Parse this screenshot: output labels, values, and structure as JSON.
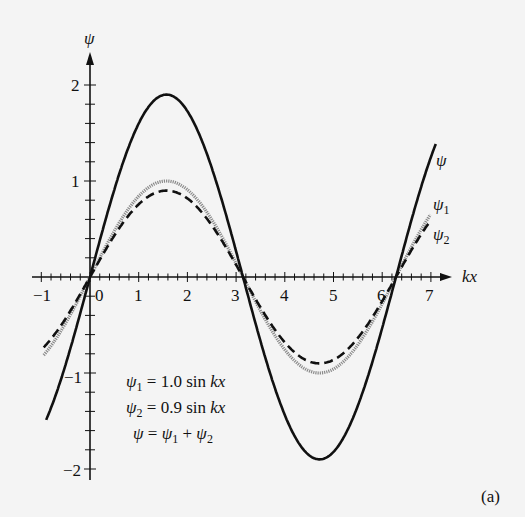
{
  "chart_data": {
    "type": "line",
    "title": "",
    "xlabel": "kx",
    "ylabel": "ψ",
    "xlim": [
      -1,
      7.4
    ],
    "ylim": [
      -2.05,
      2.4
    ],
    "grid": false,
    "x_ticks": [
      "-1",
      "0",
      "1",
      "2",
      "3",
      "4",
      "5",
      "6",
      "7"
    ],
    "y_ticks": [
      "2",
      "1",
      "-1",
      "-2"
    ],
    "series": [
      {
        "name": "ψ",
        "formula": "1.9 sin kx",
        "amplitude": 1.9,
        "style": "solid-thick",
        "color": "#111111"
      },
      {
        "name": "ψ1",
        "formula": "1.0 sin kx",
        "amplitude": 1.0,
        "style": "gray-textured",
        "color": "#888888"
      },
      {
        "name": "ψ2",
        "formula": "0.9 sin kx",
        "amplitude": 0.9,
        "style": "dashed",
        "color": "#111111"
      }
    ],
    "annotations": [
      "ψ1 = 1.0 sin kx",
      "ψ2 = 0.9 sin kx",
      "ψ = ψ1 + ψ2"
    ],
    "panel_label": "(a)"
  },
  "labels": {
    "y_axis": "ψ",
    "x_axis": "kx",
    "tick_x": [
      "−1",
      "0",
      "1",
      "2",
      "3",
      "4",
      "5",
      "6",
      "7"
    ],
    "tick_y_2": "2",
    "tick_y_1": "1",
    "tick_y_m1": "−1",
    "tick_y_m2": "−2",
    "curve_psi": "ψ",
    "curve_psi1": "ψ",
    "curve_psi1_sub": "1",
    "curve_psi2": "ψ",
    "curve_psi2_sub": "2",
    "eq1_lhs": "ψ",
    "eq1_sub": "1",
    "eq1_rhs": " = 1.0 sin ",
    "eq1_var": "kx",
    "eq2_lhs": "ψ",
    "eq2_sub": "2",
    "eq2_rhs": " = 0.9 sin ",
    "eq2_var": "kx",
    "eq3_lhs": "ψ",
    "eq3_mid": " = ",
    "eq3_a": "ψ",
    "eq3_a_sub": "1",
    "eq3_plus": " + ",
    "eq3_b": "ψ",
    "eq3_b_sub": "2",
    "panel": "(a)"
  }
}
